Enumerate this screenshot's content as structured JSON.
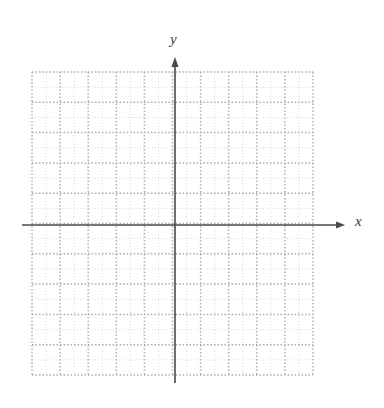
{
  "figure": {
    "kind": "cartesian-coordinate-grid",
    "width": 384,
    "height": 408,
    "background_color": "#ffffff",
    "title": ""
  },
  "axes": {
    "x_label": "x",
    "y_label": "y",
    "axis_color": "#4a4a4a",
    "axis_line_width": 1.6,
    "arrowheads": true,
    "x_axis": {
      "y_pixel": 225,
      "start_x_pixel": 22,
      "end_x_pixel": 345,
      "arrow_at": "right"
    },
    "y_axis": {
      "x_pixel": 175,
      "start_y_pixel": 383,
      "end_y_pixel": 57,
      "arrow_at": "top"
    },
    "tick_labels": [],
    "origin_label": ""
  },
  "grid": {
    "style": "dotted",
    "major_color": "#b0b0b0",
    "minor_color": "#cfcfcf",
    "left_pixel": 32,
    "right_pixel": 313,
    "top_pixel": 72,
    "bottom_pixel": 375,
    "major_columns": 10,
    "major_rows": 10,
    "minor_per_major": 2,
    "major_cell_width_pixel": 28.1,
    "major_cell_height_pixel": 30.3,
    "columns_left_of_axis": 5,
    "columns_right_of_axis": 5,
    "rows_above_axis": 5,
    "rows_below_axis": 5
  },
  "chart_data": {
    "type": "scatter",
    "title": "",
    "xlabel": "x",
    "ylabel": "y",
    "series": [
      {
        "name": "",
        "x": [],
        "y": []
      }
    ],
    "xlim": [
      -5,
      5
    ],
    "ylim": [
      -5,
      5
    ],
    "xticks": [
      -5,
      -4,
      -3,
      -2,
      -1,
      0,
      1,
      2,
      3,
      4,
      5
    ],
    "yticks": [
      -5,
      -4,
      -3,
      -2,
      -1,
      0,
      1,
      2,
      3,
      4,
      5
    ],
    "xticklabels": [],
    "yticklabels": [],
    "grid": true,
    "grid_style": "dotted",
    "legend": null,
    "annotations": [],
    "note": "Blank graph paper: empty Cartesian axes with dotted grid and no plotted data."
  }
}
